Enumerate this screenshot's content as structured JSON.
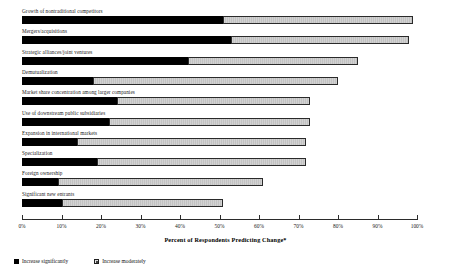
{
  "chart_data": {
    "type": "bar",
    "orientation": "horizontal",
    "stacked": true,
    "title": "",
    "xlabel": "Percent of Respondents Predicting Change*",
    "ylabel": "",
    "xlim": [
      0,
      100
    ],
    "grid": false,
    "legend_position": "bottom-left",
    "categories": [
      "Growth of nontraditional competitors",
      "Mergers/acquisitions",
      "Strategic alliances/joint ventures",
      "Demutualization",
      "Market share concentration among larger companies",
      "Use of downstream public subsidiaries",
      "Expansion in international markets",
      "Specialization",
      "Foreign ownership",
      "Significant new entrants"
    ],
    "series": [
      {
        "name": "Increase significantly",
        "values": [
          51,
          53,
          42,
          18,
          24,
          22,
          14,
          19,
          9,
          10
        ]
      },
      {
        "name": "Increase moderately",
        "values": [
          48,
          45,
          43,
          62,
          49,
          51,
          58,
          53,
          52,
          41
        ]
      }
    ],
    "totals": [
      99,
      98,
      85,
      80,
      73,
      73,
      72,
      72,
      61,
      51
    ],
    "tick_labels": [
      "0%",
      "10%",
      "20%",
      "30%",
      "40%",
      "50%",
      "60%",
      "70%",
      "80%",
      "90%",
      "100%"
    ],
    "tick_values": [
      0,
      10,
      20,
      30,
      40,
      50,
      60,
      70,
      80,
      90,
      100
    ],
    "colors": {
      "increase_significantly": "#000000",
      "increase_moderately": "#cccccc",
      "axis": "#2b2b2b",
      "text": "#111111"
    }
  },
  "legend": {
    "items": [
      {
        "label": "Increase significantly",
        "swatch": "solid-black-square-icon"
      },
      {
        "label": "Increase moderately",
        "swatch": "hatched-square-icon"
      }
    ]
  }
}
